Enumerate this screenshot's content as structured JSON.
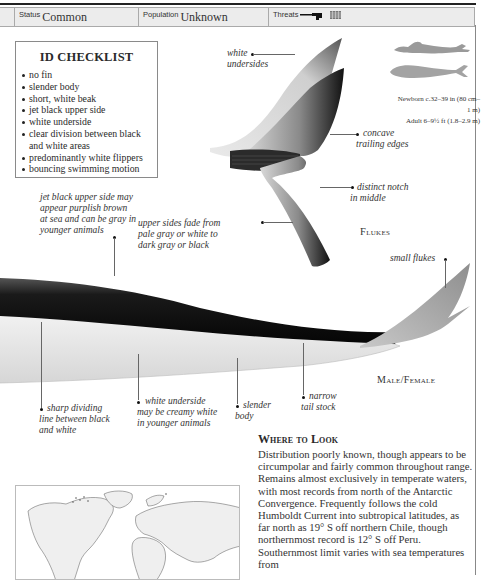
{
  "status_bar": {
    "status_label": "Status",
    "status_value": "Common",
    "population_label": "Population",
    "population_value": "Unknown",
    "threats_label": "Threats",
    "threat_icons": [
      "harpoon-gun-icon",
      "fishing-net-icon"
    ]
  },
  "checklist": {
    "title": "ID CHECKLIST",
    "items": [
      "no fin",
      "slender body",
      "short, white beak",
      "jet black upper side",
      "white underside",
      "clear division between black",
      "and white areas",
      "predominantly white flippers",
      "bouncing swimming motion"
    ]
  },
  "size_comparison": {
    "newborn": "Newborn c.32–39 in (80 cm–1 m)",
    "adult": "Adult 6–9½ ft (1.8–2.9 m)",
    "icons": [
      "human-swimmer-icon",
      "whale-silhouette-icon"
    ]
  },
  "flukes": {
    "heading": "Flukes",
    "annotations": {
      "white_undersides": [
        "white",
        "undersides"
      ],
      "concave": [
        "concave",
        "trailing edges"
      ],
      "notch": [
        "distinct notch",
        "in middle"
      ],
      "upper_sides": [
        "upper sides fade from",
        "pale gray or white to",
        "dark gray or black"
      ]
    }
  },
  "body": {
    "heading": "Male/Female",
    "annotations": {
      "jet_black": [
        "jet black upper side may",
        "appear purplish brown",
        "at sea and can be gray in",
        "younger animals"
      ],
      "small_flukes": "small flukes",
      "sharp_line": [
        "sharp dividing",
        "line between black",
        "and white"
      ],
      "white_underside": [
        "white underside",
        "may be creamy white",
        "in younger animals"
      ],
      "slender": [
        "slender",
        "body"
      ],
      "narrow": [
        "narrow",
        "tail stock"
      ]
    }
  },
  "where_to_look": {
    "heading": "Where to Look",
    "text": "Distribution poorly known, though appears to be circumpolar and fairly common throughout range. Remains almost exclusively in temperate waters, with most records from north of the Antarctic Convergence. Frequently follows the cold Humboldt Current into subtropical latitudes, as far north as 19° S off northern Chile, though northernmost record is 12° S off Peru. Southernmost limit varies with sea temperatures from"
  },
  "map": {
    "name": "world-range-map"
  }
}
